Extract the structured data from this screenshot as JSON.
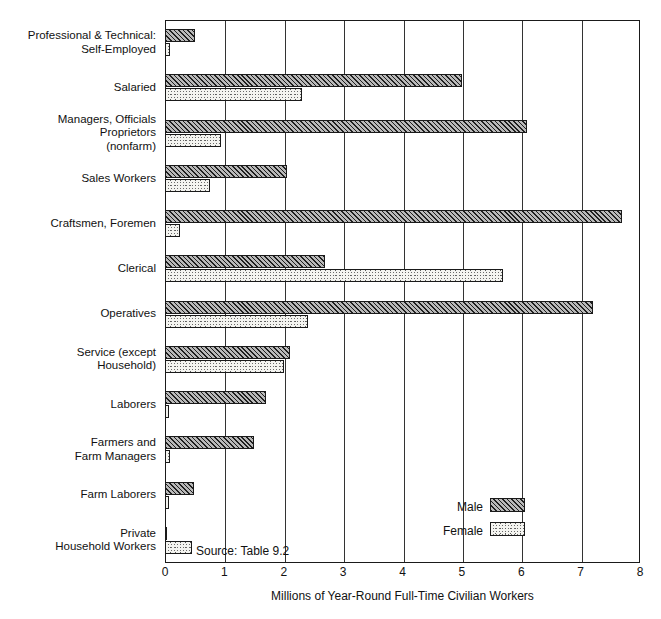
{
  "chart_data": {
    "type": "bar",
    "orientation": "horizontal",
    "title": "",
    "xlabel": "Millions of Year-Round Full-Time Civilian Workers",
    "ylabel": "",
    "xlim": [
      0,
      8
    ],
    "xticks": [
      "0",
      "1",
      "2",
      "3",
      "4",
      "5",
      "6",
      "7",
      "8"
    ],
    "grid": true,
    "legend_position": "inside-bottom-right",
    "source_note": "Source: Table 9.2",
    "categories": [
      "Professional & Technical:\nSelf-Employed",
      "Salaried",
      "Managers, Officials\nProprietors\n(nonfarm)",
      "Sales Workers",
      "Craftsmen, Foremen",
      "Clerical",
      "Operatives",
      "Service (except\nHousehold)",
      "Laborers",
      "Farmers and\nFarm Managers",
      "Farm Laborers",
      "Private\nHousehold Workers"
    ],
    "series": [
      {
        "name": "Male",
        "fill": "hatch-diagonal",
        "values": [
          0.5,
          5.0,
          6.1,
          2.05,
          7.7,
          2.7,
          7.2,
          2.1,
          1.7,
          1.5,
          0.48,
          0.02
        ]
      },
      {
        "name": "Female",
        "fill": "stipple-dots",
        "values": [
          0.08,
          2.3,
          0.95,
          0.75,
          0.25,
          5.7,
          2.4,
          2.0,
          0.06,
          0.09,
          0.07,
          0.45
        ]
      }
    ]
  },
  "legend": {
    "items": [
      {
        "label": "Male",
        "swatch": "hatch-diagonal"
      },
      {
        "label": "Female",
        "swatch": "stipple-dots"
      }
    ]
  },
  "colors": {
    "axis": "#1a1a1a",
    "grid": "#333333",
    "male_fill": "#b9b9b9",
    "female_fill": "#f4f4f0",
    "text": "#111111",
    "background": "#ffffff"
  }
}
